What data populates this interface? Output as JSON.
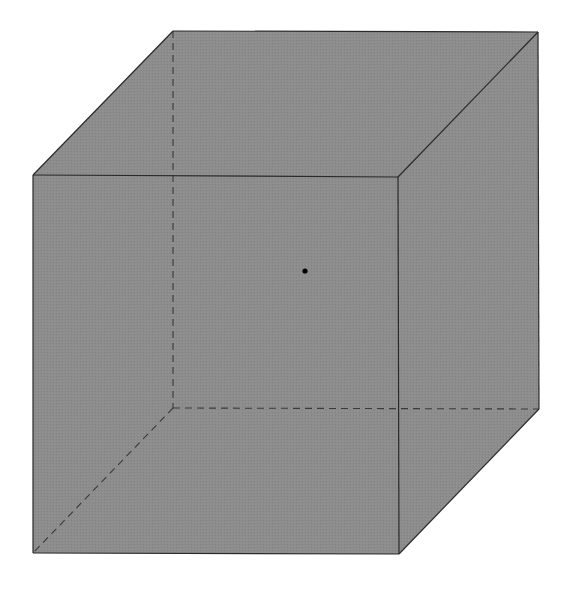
{
  "diagram": {
    "type": "cube",
    "colors": {
      "fill": "#8c8c8c",
      "edge": "#2a2a2a",
      "hidden_edge": "#3a3a3a",
      "point": "#000000",
      "background": "#ffffff"
    },
    "vertices": {
      "front_top_left": [
        33,
        175
      ],
      "front_top_right": [
        398,
        177
      ],
      "front_bottom_left": [
        33,
        553
      ],
      "front_bottom_right": [
        399,
        554
      ],
      "back_top_left": [
        173,
        31
      ],
      "back_top_right": [
        538,
        32
      ],
      "back_bottom_left": [
        173,
        408
      ],
      "back_bottom_right": [
        539,
        409
      ]
    },
    "point": {
      "x": 305,
      "y": 271,
      "r": 2.6
    },
    "visible_edges": [
      [
        "front_top_left",
        "front_top_right"
      ],
      [
        "front_top_right",
        "front_bottom_right"
      ],
      [
        "front_bottom_right",
        "front_bottom_left"
      ],
      [
        "front_bottom_left",
        "front_top_left"
      ],
      [
        "front_top_left",
        "back_top_left"
      ],
      [
        "back_top_left",
        "back_top_right"
      ],
      [
        "back_top_right",
        "front_top_right"
      ],
      [
        "back_top_right",
        "back_bottom_right"
      ],
      [
        "back_bottom_right",
        "front_bottom_right"
      ]
    ],
    "hidden_edges": [
      [
        "back_top_left",
        "back_bottom_left"
      ],
      [
        "back_bottom_left",
        "back_bottom_right"
      ],
      [
        "back_bottom_left",
        "front_bottom_left"
      ]
    ]
  }
}
